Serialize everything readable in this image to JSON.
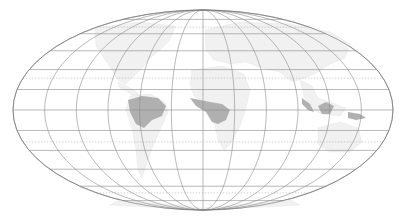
{
  "map": {
    "projection": "mollweide",
    "center": {
      "x": 203,
      "y": 110
    },
    "semi_axes": {
      "a": 190,
      "b": 100
    },
    "meridian_step_deg": 30,
    "parallels_deg": [
      -75,
      -60,
      -45,
      -30,
      -15,
      0,
      15,
      30,
      45,
      60,
      75
    ],
    "dotted_parallels_deg": [
      -66.5,
      -23.5,
      23.5,
      66.5
    ],
    "colors": {
      "background": "#ffffff",
      "graticule": "#8a8a8a",
      "land": "#f1f1f1",
      "highlight_regions": "#a9a9a9"
    },
    "highlighted_regions": [
      {
        "name": "Amazon basin"
      },
      {
        "name": "Congo basin"
      },
      {
        "name": "Southeast Asia / Borneo"
      }
    ]
  }
}
